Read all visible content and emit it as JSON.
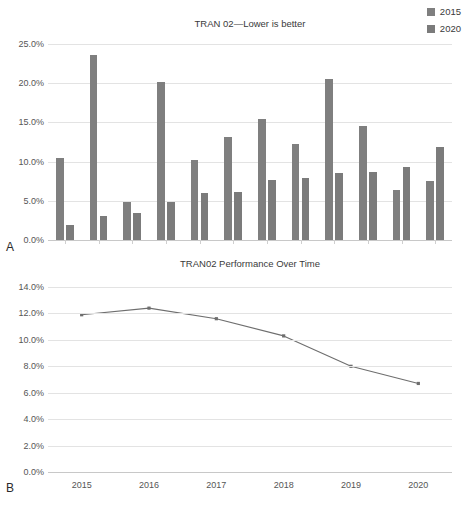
{
  "figure": {
    "panels": [
      {
        "label": "A"
      },
      {
        "label": "B"
      }
    ]
  },
  "chart_data": [
    {
      "panel": "A",
      "type": "bar",
      "title": "TRAN 02—Lower is better",
      "xlabel": "",
      "ylabel": "",
      "ylim": [
        0,
        25
      ],
      "ytick_labels": [
        "0.0%",
        "5.0%",
        "10.0%",
        "15.0%",
        "20.0%",
        "25.0%"
      ],
      "ytick_values": [
        0,
        5,
        10,
        15,
        20,
        25
      ],
      "grid": true,
      "legend_position": "top-right",
      "categories": [
        "1",
        "2",
        "3",
        "4",
        "5",
        "6",
        "7",
        "8",
        "9",
        "10",
        "11",
        "12"
      ],
      "series": [
        {
          "name": "2015",
          "color": "#7f7f7f",
          "values": [
            10.4,
            23.6,
            4.9,
            20.2,
            10.2,
            13.2,
            15.4,
            12.2,
            20.5,
            14.5,
            6.4,
            7.5
          ]
        },
        {
          "name": "2020",
          "color": "#7b7b7b",
          "values": [
            1.9,
            3.0,
            3.5,
            4.9,
            6.0,
            6.1,
            7.6,
            7.9,
            8.6,
            8.7,
            9.3,
            11.9
          ]
        }
      ]
    },
    {
      "panel": "B",
      "type": "line",
      "title": "TRAN02 Performance Over Time",
      "xlabel": "",
      "ylabel": "",
      "ylim": [
        0,
        14
      ],
      "ytick_labels": [
        "0.0%",
        "2.0%",
        "4.0%",
        "6.0%",
        "8.0%",
        "10.0%",
        "12.0%",
        "14.0%"
      ],
      "ytick_values": [
        0,
        2,
        4,
        6,
        8,
        10,
        12,
        14
      ],
      "grid": true,
      "x": [
        "2015",
        "2016",
        "2017",
        "2018",
        "2019",
        "2020"
      ],
      "series": [
        {
          "name": "TRAN02",
          "color": "#6e6e6e",
          "values": [
            11.9,
            12.4,
            11.6,
            10.3,
            8.0,
            6.7
          ]
        }
      ]
    }
  ]
}
